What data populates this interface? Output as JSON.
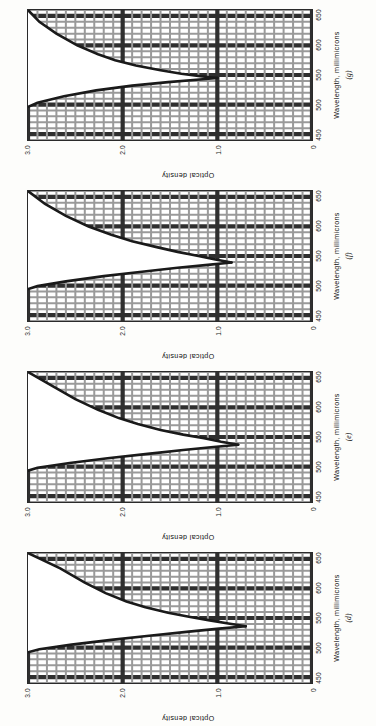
{
  "figure": {
    "panel_count": 4,
    "axis": {
      "x_title": "Wavelength, millimicrons",
      "y_title": "Optical density",
      "x_ticks": [
        "450",
        "500",
        "550",
        "600",
        "650"
      ],
      "y_ticks": [
        "0",
        "1.0",
        "2.0",
        "3.0"
      ],
      "x_min": 440,
      "x_max": 660,
      "y_min": 0,
      "y_max": 3.0,
      "grid": "major and minor",
      "grid_minor_color": "#9a9a9a",
      "grid_major_color": "#2f2f2f",
      "curve_color": "#1a1a1a"
    },
    "panels": [
      {
        "tag": "(g)",
        "order": 0,
        "chart_data": {
          "type": "line",
          "title": "",
          "xlabel": "Wavelength, millimicrons",
          "ylabel": "Optical density",
          "xlim": [
            440,
            660
          ],
          "ylim": [
            0,
            3.0
          ],
          "grid": true,
          "legend": "none",
          "series": [
            {
              "name": "absorption band (upper branch)",
              "x": [
                660,
                640,
                620,
                600,
                585,
                575,
                566,
                558,
                552,
                548,
                545
              ],
              "y": [
                3.0,
                2.88,
                2.7,
                2.48,
                2.26,
                2.08,
                1.86,
                1.6,
                1.38,
                1.18,
                1.0
              ]
            },
            {
              "name": "absorption band (lower branch)",
              "x": [
                545,
                542,
                538,
                532,
                524,
                514,
                503,
                496
              ],
              "y": [
                1.0,
                1.22,
                1.52,
                1.9,
                2.28,
                2.62,
                2.9,
                3.0
              ]
            }
          ],
          "minimum_point": {
            "x": 545,
            "y": 1.0
          }
        }
      },
      {
        "tag": "(f)",
        "order": 1,
        "chart_data": {
          "type": "line",
          "title": "",
          "xlabel": "Wavelength, millimicrons",
          "ylabel": "Optical density",
          "xlim": [
            440,
            660
          ],
          "ylim": [
            0,
            3.0
          ],
          "grid": true,
          "legend": "none",
          "series": [
            {
              "name": "absorption band (upper branch)",
              "x": [
                660,
                638,
                618,
                600,
                586,
                575,
                565,
                557,
                550,
                544,
                539
              ],
              "y": [
                3.0,
                2.82,
                2.6,
                2.36,
                2.12,
                1.9,
                1.64,
                1.42,
                1.2,
                1.02,
                0.85
              ]
            },
            {
              "name": "absorption band (lower branch)",
              "x": [
                539,
                535,
                530,
                523,
                516,
                507,
                499,
                494
              ],
              "y": [
                0.85,
                1.1,
                1.42,
                1.82,
                2.2,
                2.6,
                2.9,
                3.0
              ]
            }
          ],
          "minimum_point": {
            "x": 539,
            "y": 0.85
          }
        }
      },
      {
        "tag": "(e)",
        "order": 2,
        "chart_data": {
          "type": "line",
          "title": "",
          "xlabel": "Wavelength, millimicrons",
          "ylabel": "Optical density",
          "xlim": [
            440,
            660
          ],
          "ylim": [
            0,
            3.0
          ],
          "grid": true,
          "legend": "none",
          "series": [
            {
              "name": "absorption band (upper branch)",
              "x": [
                660,
                636,
                614,
                596,
                582,
                572,
                562,
                554,
                548,
                542,
                537
              ],
              "y": [
                3.0,
                2.74,
                2.5,
                2.26,
                2.04,
                1.84,
                1.6,
                1.36,
                1.14,
                0.96,
                0.78
              ]
            },
            {
              "name": "absorption band (lower branch)",
              "x": [
                537,
                533,
                528,
                521,
                514,
                506,
                498,
                493
              ],
              "y": [
                0.78,
                1.04,
                1.36,
                1.76,
                2.16,
                2.56,
                2.9,
                3.0
              ]
            }
          ],
          "minimum_point": {
            "x": 537,
            "y": 0.78
          }
        }
      },
      {
        "tag": "(d)",
        "order": 3,
        "chart_data": {
          "type": "line",
          "title": "",
          "xlabel": "Wavelength, millimicrons",
          "ylabel": "Optical density",
          "xlim": [
            440,
            660
          ],
          "ylim": [
            0,
            3.0
          ],
          "grid": true,
          "legend": "none",
          "series": [
            {
              "name": "absorption band (upper branch)",
              "x": [
                660,
                634,
                610,
                592,
                578,
                568,
                559,
                552,
                546,
                541,
                536
              ],
              "y": [
                3.0,
                2.66,
                2.4,
                2.18,
                1.96,
                1.76,
                1.52,
                1.3,
                1.08,
                0.9,
                0.7
              ]
            },
            {
              "name": "absorption band (lower branch)",
              "x": [
                536,
                532,
                527,
                520,
                513,
                505,
                497,
                492
              ],
              "y": [
                0.7,
                0.98,
                1.3,
                1.72,
                2.12,
                2.54,
                2.88,
                3.0
              ]
            }
          ],
          "minimum_point": {
            "x": 536,
            "y": 0.7
          }
        }
      }
    ]
  }
}
